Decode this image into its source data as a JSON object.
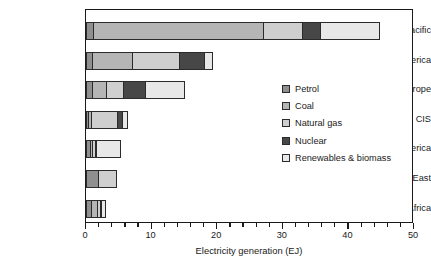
{
  "chart_data": {
    "type": "bar",
    "orientation": "horizontal",
    "stacked": true,
    "title": "",
    "xlabel": "Electricity generation (EJ)",
    "ylabel": "",
    "xlim": [
      0,
      50
    ],
    "xticks": [
      0,
      10,
      20,
      30,
      40,
      50
    ],
    "xtick_labels": [
      "0",
      "10",
      "20",
      "30",
      "40",
      "50"
    ],
    "minor_tick_interval": 2,
    "grid": false,
    "legend_position": "inside-right",
    "categories": [
      "Asia Pacific",
      "North America",
      "Europe",
      "CIS",
      "S&C America",
      "Middle East",
      "Africa"
    ],
    "series": [
      {
        "name": "Petrol",
        "color": "#8f8f8f",
        "values": [
          1.0,
          1.0,
          1.0,
          0.3,
          0.6,
          2.0,
          0.8
        ]
      },
      {
        "name": "Coal",
        "color": "#b5b5b5",
        "values": [
          26.2,
          6.2,
          2.1,
          0.5,
          0.3,
          0.0,
          1.0
        ]
      },
      {
        "name": "Natural gas",
        "color": "#cfcfcf",
        "values": [
          6.0,
          7.2,
          2.6,
          4.2,
          0.5,
          2.7,
          0.6
        ]
      },
      {
        "name": "Nuclear",
        "color": "#474747",
        "values": [
          2.7,
          3.8,
          3.5,
          0.8,
          0.1,
          0.0,
          0.2
        ]
      },
      {
        "name": "Renewables & biomass",
        "color": "#e8e8e8",
        "values": [
          8.9,
          1.2,
          5.9,
          0.6,
          3.8,
          0.0,
          0.5
        ]
      }
    ],
    "totals": [
      44.8,
      19.4,
      15.1,
      6.4,
      5.3,
      4.7,
      3.1
    ]
  },
  "legend": {
    "items": [
      {
        "label": "Petrol"
      },
      {
        "label": "Coal"
      },
      {
        "label": "Natural gas"
      },
      {
        "label": "Nuclear"
      },
      {
        "label": "Renewables & biomass"
      }
    ]
  },
  "axis": {
    "x_title": "Electricity generation (EJ)"
  }
}
